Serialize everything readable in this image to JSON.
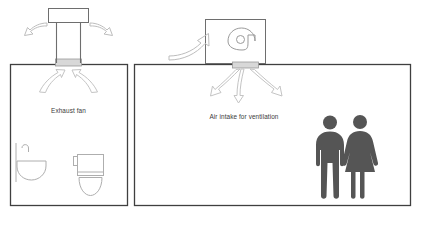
{
  "diagram": {
    "background_color": "#ffffff",
    "line_color": "#3f3f3f",
    "arrow_color": "#b0b0b0",
    "fixture_color": "#a9a9a9",
    "person_color": "#555555",
    "label_color": "#3a3a3a"
  },
  "rooms": [
    {
      "id": "bathroom",
      "label": "Exhaust fan",
      "fixtures": [
        "sink-fixture",
        "toilet-fixture"
      ],
      "equipment": "roof-exhaust-fan",
      "airflow": "out"
    },
    {
      "id": "living-room",
      "label": "Air intake for ventilation",
      "fixtures": [
        "person-male",
        "person-female"
      ],
      "equipment": "roof-blower-unit",
      "airflow": "in"
    }
  ],
  "labels": {
    "exhaust_fan": "Exhaust fan",
    "air_intake": "Air intake for ventilation",
    "footer_note": ""
  },
  "icons": {
    "exhaust_fan_cap": "fan-cap-icon",
    "blower": "blower-wheel-icon",
    "sink": "sink-icon",
    "toilet": "toilet-icon",
    "male": "person-male-icon",
    "female": "person-female-icon",
    "arrow_out_left": "arrow-exhaust-left-icon",
    "arrow_out_right": "arrow-exhaust-right-icon",
    "arrow_up_left": "arrow-intake-up-left-icon",
    "arrow_up_right": "arrow-intake-up-right-icon",
    "arrow_supply_left": "arrow-supply-left-icon",
    "arrow_supply_down": "arrow-supply-down-icon",
    "arrow_supply_right": "arrow-supply-right-icon",
    "arrow_outside_air": "arrow-outside-air-icon"
  }
}
